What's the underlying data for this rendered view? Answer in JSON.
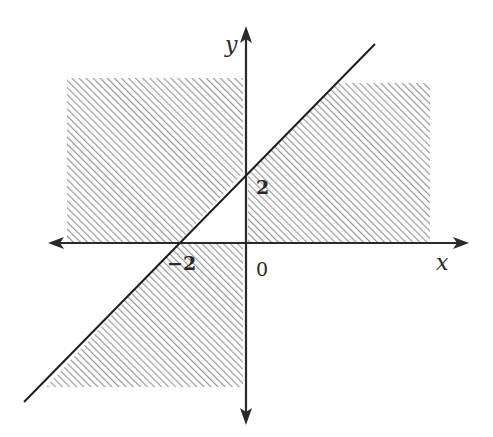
{
  "diagram": {
    "type": "linear-inequality-region-graph",
    "axes": {
      "x_label": "x",
      "y_label": "y",
      "origin_label": "0"
    },
    "intercepts": {
      "x_intercept_label": "−2",
      "y_intercept_label": "2"
    },
    "line": {
      "equation": "y = x + 2",
      "passes_through": [
        [
          -2,
          0
        ],
        [
          0,
          2
        ]
      ]
    },
    "shaded_regions": [
      {
        "name": "upper-left",
        "description": "x < 0, y > 0, left/above the line"
      },
      {
        "name": "upper-right",
        "description": "x > 0, y > 0, below the line"
      },
      {
        "name": "lower-left",
        "description": "x < 0, y < 0, right of the line"
      }
    ],
    "colors": {
      "axis": "#2a2a2a",
      "line": "#1e1e1e",
      "hatch": "#9a9a9a",
      "background": "#ffffff"
    }
  }
}
